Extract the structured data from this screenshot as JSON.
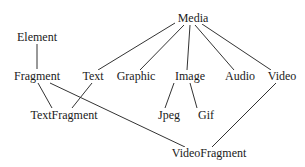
{
  "diagram": {
    "type": "class-hierarchy",
    "line_color": "#333333",
    "nodes": [
      {
        "id": "media",
        "label": "Media",
        "x": 193,
        "y": 18
      },
      {
        "id": "element",
        "label": "Element",
        "x": 37,
        "y": 37
      },
      {
        "id": "fragment",
        "label": "Fragment",
        "x": 37,
        "y": 76
      },
      {
        "id": "text",
        "label": "Text",
        "x": 93,
        "y": 76
      },
      {
        "id": "graphic",
        "label": "Graphic",
        "x": 136,
        "y": 76
      },
      {
        "id": "image",
        "label": "Image",
        "x": 190,
        "y": 76
      },
      {
        "id": "audio",
        "label": "Audio",
        "x": 240,
        "y": 76
      },
      {
        "id": "video",
        "label": "Video",
        "x": 282,
        "y": 76
      },
      {
        "id": "textfragment",
        "label": "TextFragment",
        "x": 64,
        "y": 115
      },
      {
        "id": "jpeg",
        "label": "Jpeg",
        "x": 169,
        "y": 115
      },
      {
        "id": "gif",
        "label": "Gif",
        "x": 206,
        "y": 115
      },
      {
        "id": "videofragment",
        "label": "VideoFragment",
        "x": 209,
        "y": 153
      }
    ],
    "edges": [
      {
        "from": "element",
        "to": "fragment",
        "x1": 37,
        "y1": 44,
        "x2": 37,
        "y2": 69
      },
      {
        "from": "media",
        "to": "text",
        "x1": 175,
        "y1": 23,
        "x2": 98,
        "y2": 70
      },
      {
        "from": "media",
        "to": "graphic",
        "x1": 184,
        "y1": 25,
        "x2": 140,
        "y2": 70
      },
      {
        "from": "media",
        "to": "image",
        "x1": 190,
        "y1": 25,
        "x2": 187,
        "y2": 70
      },
      {
        "from": "media",
        "to": "audio",
        "x1": 195,
        "y1": 25,
        "x2": 234,
        "y2": 70
      },
      {
        "from": "media",
        "to": "video",
        "x1": 202,
        "y1": 24,
        "x2": 271,
        "y2": 70
      },
      {
        "from": "fragment",
        "to": "textfragment",
        "x1": 38,
        "y1": 83,
        "x2": 52,
        "y2": 108
      },
      {
        "from": "text",
        "to": "textfragment",
        "x1": 92,
        "y1": 83,
        "x2": 72,
        "y2": 108
      },
      {
        "from": "fragment",
        "to": "videofragment",
        "x1": 50,
        "y1": 83,
        "x2": 185,
        "y2": 147
      },
      {
        "from": "image",
        "to": "jpeg",
        "x1": 174,
        "y1": 83,
        "x2": 165,
        "y2": 108
      },
      {
        "from": "image",
        "to": "gif",
        "x1": 190,
        "y1": 83,
        "x2": 197,
        "y2": 108
      },
      {
        "from": "video",
        "to": "videofragment",
        "x1": 276,
        "y1": 83,
        "x2": 212,
        "y2": 147
      }
    ]
  }
}
